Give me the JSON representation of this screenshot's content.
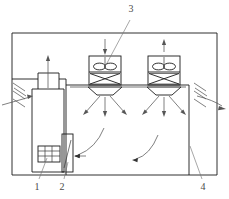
{
  "diagram": {
    "type": "technical-line-drawing",
    "canvas": {
      "width": 229,
      "height": 199
    },
    "colors": {
      "outline": "#1a1a1a",
      "detail": "#3a3a3a",
      "airflow": "#555555",
      "leader": "#777777",
      "label_text": "#4a4a4a",
      "background": "#ffffff"
    },
    "callouts": [
      {
        "id": "callout-3",
        "label": "3",
        "x": 131,
        "y": 12,
        "target": "supply-fan-unit-left",
        "description": "ceiling mounted fan / air handling unit"
      },
      {
        "id": "callout-1",
        "label": "1",
        "x": 37,
        "y": 186,
        "target": "heat-exchanger-coil",
        "description": "heat exchanger coil inside floor unit"
      },
      {
        "id": "callout-2",
        "label": "2",
        "x": 62,
        "y": 186,
        "target": "narrow-riser-duct",
        "description": "narrow riser duct / return opening"
      },
      {
        "id": "callout-4",
        "label": "4",
        "x": 203,
        "y": 186,
        "target": "chamber-right-wall",
        "description": "chamber enclosure right wall"
      }
    ],
    "components": [
      {
        "name": "outer-enclosure",
        "description": "outer rectangular boundary of the room"
      },
      {
        "name": "inner-chamber",
        "description": "inner conditioned chamber with ceiling slab"
      },
      {
        "name": "floor-unit",
        "description": "tall vertical air handling cabinet at left"
      },
      {
        "name": "supply-fan-unit-left",
        "description": "fan box with impeller and damper, downward intake arrow"
      },
      {
        "name": "supply-fan-unit-right",
        "description": "fan box with impeller and damper, upward exhaust arrow"
      },
      {
        "name": "diffuser-left",
        "description": "trapezoidal ceiling diffuser with radiating spray arrows"
      },
      {
        "name": "diffuser-right",
        "description": "trapezoidal ceiling diffuser with radiating spray arrows"
      },
      {
        "name": "inlet-louvres-left",
        "description": "diagonal hatch strokes indicating outside air entering at left"
      },
      {
        "name": "outlet-louvres-right",
        "description": "diagonal hatch strokes indicating air leaving at right"
      },
      {
        "name": "recirculation-arrows",
        "description": "curved arrows showing floor level return flow toward the left unit"
      }
    ],
    "airflow": {
      "intake_direction": "left-inward",
      "exhaust_direction": "right-outward",
      "riser_direction": "upward",
      "return_direction": "leftward-along-floor"
    }
  }
}
